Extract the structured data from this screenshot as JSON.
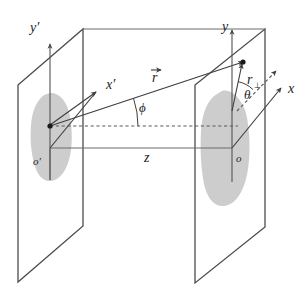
{
  "figure": {
    "kind": "geometry-diagram",
    "background_color": "#ffffff",
    "line_color": "#4d4d4d",
    "blob_color": "#c9c9c9",
    "text_color": "#1d1d1d"
  },
  "labels": {
    "y_prime": "y′",
    "x_prime": "x′",
    "o_prime": "o′",
    "y": "y",
    "x": "x",
    "o": "o",
    "z": "z",
    "r_vector": "r",
    "r_perp": "r",
    "r_perp_sub": "⊥",
    "phi": "ϕ",
    "theta": "θ"
  },
  "elements": {
    "left_plane": {
      "name": "source-plane",
      "points": "18,85 83,29 83,226 18,282"
    },
    "right_plane": {
      "name": "observation-plane",
      "points": "195,85 265,29 265,227 195,283"
    },
    "left_blob": {
      "name": "source-intensity-blob",
      "path": "M 44,95 C 36,101 32,112 31,125 C 30,139 31,152 34,163 C 37,175 43,182 51,181 C 60,180 67,170 70,156 C 73,142 72,125 69,112 C 66,100 58,92 50,93 Z"
    },
    "right_blob": {
      "name": "observation-intensity-blob",
      "path": "M 217,94 C 207,100 202,114 201,131 C 200,150 201,169 204,184 C 207,198 214,207 224,206 C 235,205 243,193 247,175 C 251,155 250,130 246,113 C 242,99 231,88 222,91 Z"
    },
    "y_prime_axis": {
      "name": "y-prime-axis",
      "x1": 50,
      "y1": 180,
      "x2": 50,
      "y2": 44
    },
    "y_axis": {
      "name": "y-axis",
      "x1": 232,
      "y1": 182,
      "x2": 232,
      "y2": 30
    },
    "x_prime_axis": {
      "name": "x-prime-axis",
      "x1": 50,
      "y1": 125,
      "x2": 96,
      "y2": 92
    },
    "x_axis": {
      "name": "x-axis",
      "x1": 232,
      "y1": 148,
      "x2": 281,
      "y2": 88
    },
    "x_axis_dashed": {
      "name": "x-axis-dashed-extension",
      "x1": 237,
      "y1": 111,
      "x2": 276,
      "y2": 71
    },
    "z_axis": {
      "name": "z-axis-baseline",
      "x1": 50,
      "y1": 148,
      "x2": 232,
      "y2": 148
    },
    "phi_reference_dashed": {
      "name": "phi-reference-dashed-line",
      "x1": 50,
      "y1": 126,
      "x2": 238,
      "y2": 126
    },
    "r_vector_ray": {
      "name": "position-vector-r",
      "x1": 50,
      "y1": 126,
      "x2": 243,
      "y2": 62
    },
    "r_perp_segment": {
      "name": "r-perpendicular-segment",
      "x1": 232,
      "y1": 111,
      "x2": 242,
      "y2": 64
    },
    "phi_arc": {
      "name": "phi-angle-arc",
      "cx": 50,
      "cy": 126,
      "r": 88
    },
    "theta_arc": {
      "name": "theta-angle-arc",
      "cx": 232,
      "cy": 111,
      "r": 30
    },
    "point_source": {
      "name": "source-point-marker",
      "cx": 50,
      "cy": 126
    },
    "point_observation": {
      "name": "observation-point-marker",
      "cx": 243,
      "cy": 62
    },
    "connector_top": {
      "name": "plane-top-connector",
      "x1": 83,
      "y1": 29,
      "x2": 265,
      "y2": 29
    },
    "origin_connector_left": {
      "name": "origin-left-vertical-tick",
      "x1": 50,
      "y1": 148,
      "x2": 50,
      "y2": 180
    },
    "left_ray_to_origin": {
      "name": "source-to-origin-ray",
      "x1": 50,
      "y1": 148,
      "x2": 96,
      "y2": 92
    }
  },
  "label_positions": {
    "y_prime": {
      "x": 30,
      "y": 32
    },
    "x_prime": {
      "x": 106,
      "y": 89
    },
    "o_prime": {
      "x": 33,
      "y": 165
    },
    "y": {
      "x": 222,
      "y": 31
    },
    "x": {
      "x": 288,
      "y": 93
    },
    "o": {
      "x": 236,
      "y": 162
    },
    "z": {
      "x": 144,
      "y": 162
    },
    "r_vector": {
      "x": 152,
      "y": 82
    },
    "r_perp": {
      "x": 247,
      "y": 84
    },
    "phi": {
      "x": 139,
      "y": 112
    },
    "theta": {
      "x": 244,
      "y": 99
    }
  }
}
